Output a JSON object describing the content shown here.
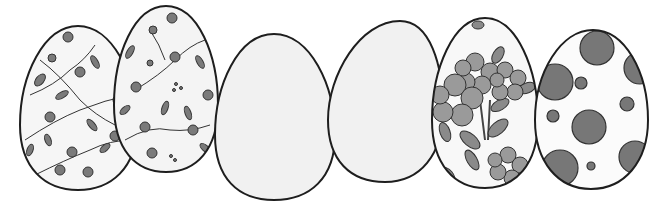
{
  "scene": {
    "title": "Six decorated eggs",
    "background": "#ffffff",
    "outline_color": "#1e1e1e",
    "eggs": [
      {
        "id": "egg-1",
        "pattern": "small-floral",
        "cx": 78,
        "cy": 108,
        "rx": 58,
        "ry": 82,
        "fill": "#f6f6f6"
      },
      {
        "id": "egg-2",
        "pattern": "small-floral",
        "cx": 166,
        "cy": 89,
        "rx": 52,
        "ry": 83,
        "fill": "#f4f4f4"
      },
      {
        "id": "egg-3",
        "pattern": "plain",
        "cx": 275,
        "cy": 117,
        "rx": 60,
        "ry": 84,
        "fill": "#f1f1f1"
      },
      {
        "id": "egg-4",
        "pattern": "plain",
        "cx": 385,
        "cy": 102,
        "rx": 57,
        "ry": 82,
        "fill": "#f1f1f1"
      },
      {
        "id": "egg-5",
        "pattern": "large-floral",
        "cx": 485,
        "cy": 103,
        "rx": 53,
        "ry": 85,
        "fill": "#f8f8f8"
      },
      {
        "id": "egg-6",
        "pattern": "polka-dots",
        "cx": 591,
        "cy": 109,
        "rx": 56,
        "ry": 80,
        "fill": "#fbfbfb"
      }
    ],
    "colors": {
      "dot": "#777777",
      "flower_petal": "#9a9a9a",
      "leaf": "#8a8a8a",
      "small_flower": "#6f6f6f"
    }
  }
}
